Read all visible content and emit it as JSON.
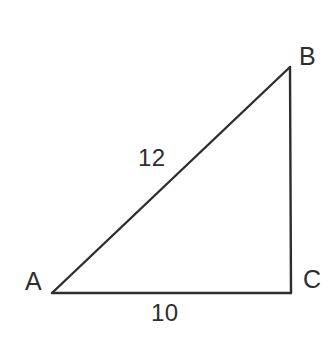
{
  "diagram": {
    "type": "right-triangle",
    "background_color": "#ffffff",
    "stroke_color": "#2e2e2e",
    "text_color": "#2e2e2e",
    "stroke_width": 2.4,
    "vertices": [
      {
        "name": "A",
        "label": "A",
        "x": 52,
        "y": 293
      },
      {
        "name": "B",
        "label": "B",
        "x": 290,
        "y": 67
      },
      {
        "name": "C",
        "label": "C",
        "x": 291,
        "y": 293
      }
    ],
    "sides": [
      {
        "name": "hypotenuse",
        "from": "A",
        "to": "B",
        "label": "12"
      },
      {
        "name": "base",
        "from": "A",
        "to": "C",
        "label": "10"
      },
      {
        "name": "vertical",
        "from": "B",
        "to": "C",
        "label": ""
      }
    ],
    "labels": {
      "vertex_a": "A",
      "vertex_b": "B",
      "vertex_c": "C",
      "hypotenuse_length": "12",
      "base_length": "10"
    }
  }
}
